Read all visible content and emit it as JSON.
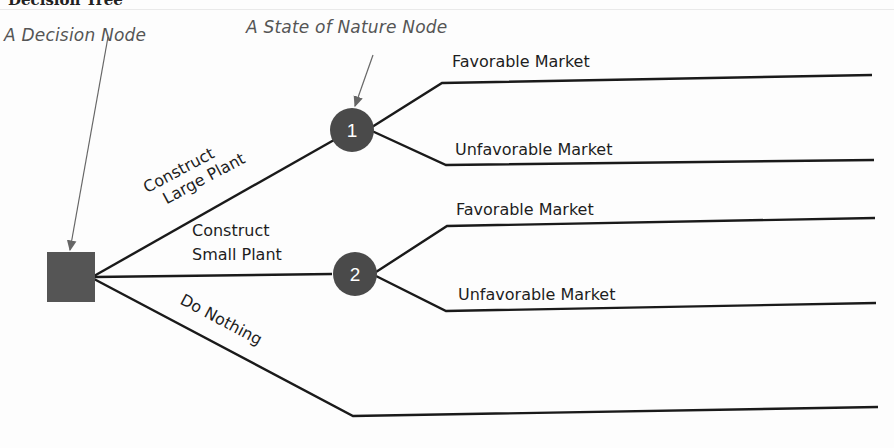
{
  "diagram": {
    "title": "Decision Tree",
    "callouts": {
      "decision_node": "A Decision Node",
      "state_of_nature_node": "A State of Nature Node"
    },
    "decision_node": {
      "shape": "square",
      "color": "#555555"
    },
    "alternatives": [
      {
        "label_line1": "Construct",
        "label_line2": "Large Plant",
        "node": "1"
      },
      {
        "label_line1": "Construct",
        "label_line2": "Small Plant",
        "node": "2"
      },
      {
        "label": "Do Nothing"
      }
    ],
    "outcomes": {
      "node1": [
        "Favorable Market",
        "Unfavorable Market"
      ],
      "node2": [
        "Favorable Market",
        "Unfavorable Market"
      ]
    },
    "colors": {
      "line": "#1a1a1a",
      "node_fill": "#4a4a4a",
      "node_text": "#ffffff",
      "callout_text": "#555555",
      "arrow": "#666666"
    }
  }
}
